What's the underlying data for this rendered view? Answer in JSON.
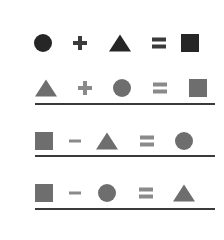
{
  "colors": {
    "dark": "#262626",
    "gray": "#6e6e6e",
    "operator_dark": "#3a3a3a",
    "operator_gray": "#8a8a8a",
    "rule": "#3a3a3a"
  },
  "equations": [
    {
      "row": 1,
      "tone": "dark",
      "tokens": [
        "circle",
        "plus",
        "triangle",
        "equals",
        "square"
      ],
      "underlined": false
    },
    {
      "row": 2,
      "tone": "gray",
      "tokens": [
        "triangle",
        "plus",
        "circle",
        "equals",
        "square"
      ],
      "underlined": true
    },
    {
      "row": 3,
      "tone": "gray",
      "tokens": [
        "square",
        "minus",
        "triangle",
        "equals",
        "circle"
      ],
      "underlined": true
    },
    {
      "row": 4,
      "tone": "gray",
      "tokens": [
        "square",
        "minus",
        "circle",
        "equals",
        "triangle"
      ],
      "underlined": true
    }
  ]
}
